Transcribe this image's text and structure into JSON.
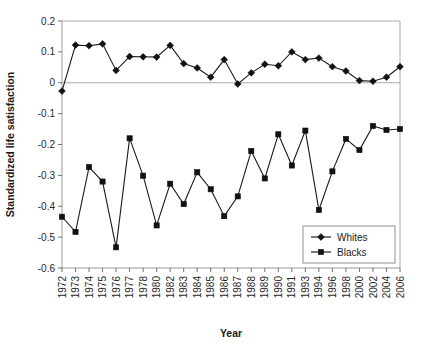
{
  "chart_data": {
    "type": "line",
    "title": "",
    "xlabel": "Year",
    "ylabel": "Standardized life satisfaction",
    "ylim": [
      -0.6,
      0.2
    ],
    "ytick_labels": [
      "0.2",
      "0.1",
      "0",
      "-0.1",
      "-0.2",
      "-0.3",
      "-0.4",
      "-0.5",
      "-0.6"
    ],
    "ytick_values": [
      0.2,
      0.1,
      0,
      -0.1,
      -0.2,
      -0.3,
      -0.4,
      -0.5,
      -0.6
    ],
    "grid": false,
    "legend_position": "bottom-right",
    "categories": [
      "1972",
      "1973",
      "1974",
      "1975",
      "1976",
      "1977",
      "1978",
      "1980",
      "1982",
      "1983",
      "1984",
      "1985",
      "1986",
      "1987",
      "1988",
      "1989",
      "1990",
      "1991",
      "1993",
      "1994",
      "1996",
      "1998",
      "2000",
      "2002",
      "2004",
      "2006"
    ],
    "series": [
      {
        "name": "Whites",
        "marker": "diamond",
        "values": [
          -0.027,
          0.122,
          0.12,
          0.126,
          0.04,
          0.085,
          0.084,
          0.083,
          0.121,
          0.062,
          0.048,
          0.018,
          0.075,
          -0.004,
          0.032,
          0.06,
          0.055,
          0.1,
          0.075,
          0.08,
          0.052,
          0.038,
          0.007,
          0.005,
          0.018,
          0.052
        ]
      },
      {
        "name": "Blacks",
        "marker": "square",
        "values": [
          -0.434,
          -0.483,
          -0.273,
          -0.32,
          -0.533,
          -0.18,
          -0.301,
          -0.462,
          -0.327,
          -0.393,
          -0.29,
          -0.345,
          -0.432,
          -0.368,
          -0.221,
          -0.31,
          -0.167,
          -0.268,
          -0.155,
          -0.412,
          -0.287,
          -0.182,
          -0.218,
          -0.14,
          -0.153,
          -0.15
        ]
      }
    ]
  },
  "legend": {
    "items": [
      {
        "label": "Whites"
      },
      {
        "label": "Blacks"
      }
    ]
  }
}
